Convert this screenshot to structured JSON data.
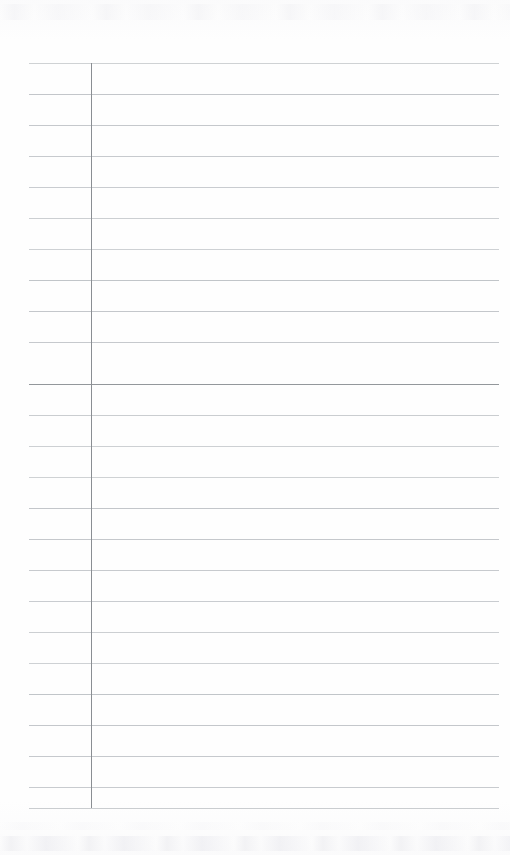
{
  "document": {
    "kind": "scanned-blank-lined-page",
    "title": "Blank Ruled Notebook Page",
    "content_text": "",
    "page_width": 510,
    "page_height": 855,
    "paper_color": "#fefefe",
    "background_color": "#ffffff"
  },
  "ruling": {
    "line_color": "#bcc0c4",
    "emphasis_line_color": "#8d9196",
    "line_thickness": 1,
    "line_count": 25,
    "first_line_y": 63,
    "line_spacing": 31,
    "line_start_x": 29,
    "line_end_x": 499,
    "emphasis_line_index": 10,
    "line_y_positions": [
      63,
      94,
      125,
      156,
      187,
      218,
      249,
      280,
      311,
      342,
      384,
      415,
      446,
      477,
      508,
      539,
      570,
      601,
      632,
      663,
      694,
      725,
      756,
      787,
      808
    ]
  },
  "margin_rule": {
    "color": "#8a8e93",
    "thickness": 1,
    "x": 91,
    "top_y": 63,
    "bottom_y": 808
  },
  "artifacts": {
    "top_smudge_label": "scan-noise-top",
    "bottom_smudge_label": "scan-noise-bottom"
  }
}
